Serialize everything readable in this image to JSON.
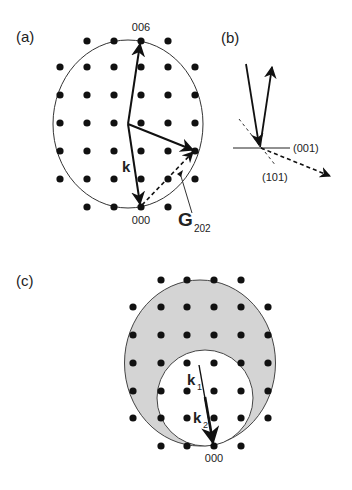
{
  "panels": {
    "a": {
      "label": "(a)",
      "top_point_label": "006",
      "origin_label": "000",
      "k_label": "k",
      "g_label": "G",
      "g_subscript": "202"
    },
    "b": {
      "label": "(b)",
      "plane_001_label": "(001)",
      "plane_101_label": "(101)"
    },
    "c": {
      "label": "(c)",
      "k1_label": "k",
      "k1_subscript": "1",
      "k2_label": "k",
      "k2_subscript": "2",
      "origin_label": "000"
    }
  },
  "colors": {
    "ink": "#111111",
    "line": "#222222",
    "shaded_region": "#d4d4d4",
    "background": "#ffffff"
  }
}
